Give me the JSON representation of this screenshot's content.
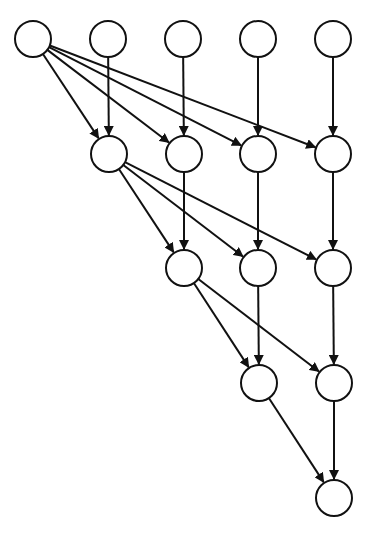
{
  "diagram": {
    "width": 374,
    "height": 543,
    "node_radius": 18,
    "stroke_color": "#111111",
    "fill_color": "#ffffff",
    "stroke_width": 2,
    "nodes": [
      {
        "id": "r1c1",
        "x": 33,
        "y": 39
      },
      {
        "id": "r1c2",
        "x": 108,
        "y": 39
      },
      {
        "id": "r1c3",
        "x": 183,
        "y": 39
      },
      {
        "id": "r1c4",
        "x": 258,
        "y": 39
      },
      {
        "id": "r1c5",
        "x": 333,
        "y": 39
      },
      {
        "id": "r2c2",
        "x": 109,
        "y": 154
      },
      {
        "id": "r2c3",
        "x": 184,
        "y": 154
      },
      {
        "id": "r2c4",
        "x": 258,
        "y": 154
      },
      {
        "id": "r2c5",
        "x": 333,
        "y": 154
      },
      {
        "id": "r3c3",
        "x": 184,
        "y": 268
      },
      {
        "id": "r3c4",
        "x": 258,
        "y": 268
      },
      {
        "id": "r3c5",
        "x": 333,
        "y": 268
      },
      {
        "id": "r4c4",
        "x": 259,
        "y": 383
      },
      {
        "id": "r4c5",
        "x": 334,
        "y": 383
      },
      {
        "id": "r5c5",
        "x": 334,
        "y": 498
      }
    ],
    "edges": [
      [
        "r1c1",
        "r2c2"
      ],
      [
        "r1c1",
        "r2c3"
      ],
      [
        "r1c1",
        "r2c4"
      ],
      [
        "r1c1",
        "r2c5"
      ],
      [
        "r1c2",
        "r2c2"
      ],
      [
        "r1c3",
        "r2c3"
      ],
      [
        "r1c4",
        "r2c4"
      ],
      [
        "r1c5",
        "r2c5"
      ],
      [
        "r2c2",
        "r3c3"
      ],
      [
        "r2c2",
        "r3c4"
      ],
      [
        "r2c2",
        "r3c5"
      ],
      [
        "r2c3",
        "r3c3"
      ],
      [
        "r2c4",
        "r3c4"
      ],
      [
        "r2c5",
        "r3c5"
      ],
      [
        "r3c3",
        "r4c4"
      ],
      [
        "r3c3",
        "r4c5"
      ],
      [
        "r3c4",
        "r4c4"
      ],
      [
        "r3c5",
        "r4c5"
      ],
      [
        "r4c4",
        "r5c5"
      ],
      [
        "r4c5",
        "r5c5"
      ]
    ]
  }
}
